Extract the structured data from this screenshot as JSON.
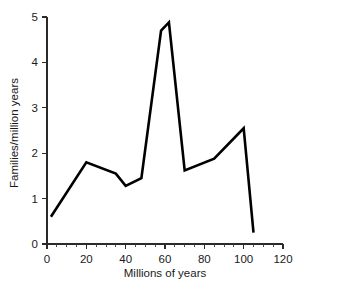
{
  "chart_data": {
    "type": "line",
    "title": "",
    "xlabel": "Millions of years",
    "ylabel": "Families/million years",
    "xlim": [
      0,
      120
    ],
    "ylim": [
      0,
      5
    ],
    "grid": false,
    "legend": "none",
    "x_ticks": [
      0,
      20,
      40,
      60,
      80,
      100,
      120
    ],
    "x_tick_labels": [
      "0",
      "20",
      "40",
      "60",
      "80",
      "100",
      "120"
    ],
    "x_minor_step": 5,
    "y_ticks": [
      0,
      1,
      2,
      3,
      4,
      5
    ],
    "y_tick_labels": [
      "0",
      "1",
      "2",
      "3",
      "4",
      "5"
    ],
    "series": [
      {
        "name": "Family extinction rate",
        "color": "#000000",
        "x": [
          2,
          20,
          35,
          40,
          48,
          58,
          62,
          70,
          85,
          100,
          105
        ],
        "y": [
          0.6,
          1.8,
          1.55,
          1.28,
          1.45,
          4.7,
          4.88,
          1.62,
          1.88,
          2.55,
          0.25
        ]
      }
    ]
  },
  "axes": {
    "x_axis_name": "Millions of years",
    "y_axis_name": "Families/million years"
  }
}
